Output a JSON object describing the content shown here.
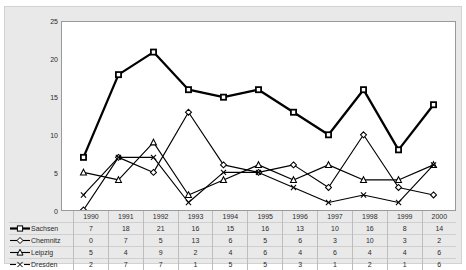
{
  "chart_data": {
    "type": "line",
    "title": "",
    "xlabel": "",
    "ylabel": "",
    "ylim": [
      0,
      25
    ],
    "yticks": [
      0,
      5,
      10,
      15,
      20,
      25
    ],
    "grid": false,
    "legend_position": "bottom-left-table",
    "categories": [
      "1990",
      "1991",
      "1992",
      "1993",
      "1994",
      "1995",
      "1996",
      "1997",
      "1998",
      "1999",
      "2000"
    ],
    "series": [
      {
        "name": "Sachsen",
        "marker": "square",
        "values": [
          7,
          18,
          21,
          16,
          15,
          16,
          13,
          10,
          16,
          8,
          14
        ]
      },
      {
        "name": "Chemnitz",
        "marker": "diamond",
        "values": [
          0,
          7,
          5,
          13,
          6,
          5,
          6,
          3,
          10,
          3,
          2
        ]
      },
      {
        "name": "Leipzig",
        "marker": "triangle",
        "values": [
          5,
          4,
          9,
          2,
          4,
          6,
          4,
          6,
          4,
          4,
          6
        ]
      },
      {
        "name": "Dresden",
        "marker": "cross",
        "values": [
          2,
          7,
          7,
          1,
          5,
          5,
          3,
          1,
          2,
          1,
          6
        ]
      }
    ]
  },
  "colors": {
    "series_line": "#000000",
    "plot_background": "#ffffff",
    "chart_background": "#e9e9e9",
    "axis": "#9a9a9a",
    "text": "#2b2b2b",
    "table_rule": "#bdbdbd"
  }
}
